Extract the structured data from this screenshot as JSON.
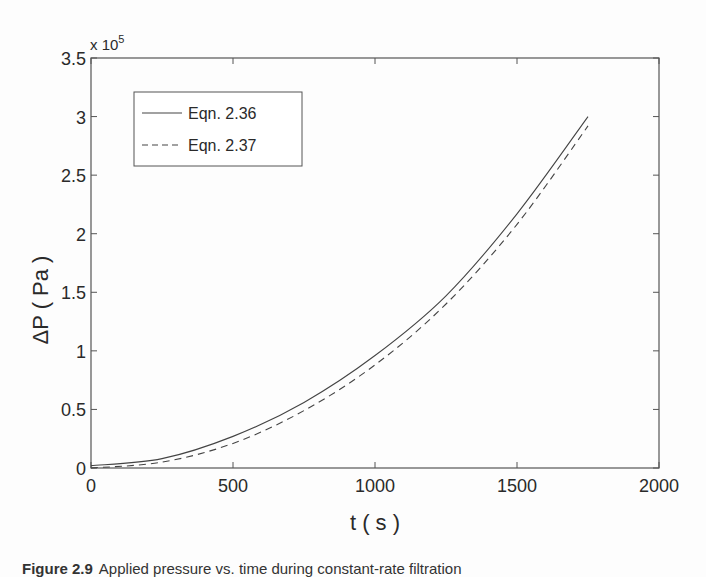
{
  "chart_data": {
    "type": "line",
    "title": "",
    "xlabel": "t ( s )",
    "ylabel": "ΔP ( Pa )",
    "y_multiplier": "x 10^5",
    "xlim": [
      0,
      2000
    ],
    "ylim": [
      0,
      3.5
    ],
    "x_ticks": [
      "0",
      "500",
      "1000",
      "1500",
      "2000"
    ],
    "y_ticks": [
      "0",
      "0.5",
      "1",
      "1.5",
      "2",
      "2.5",
      "3",
      "3.5"
    ],
    "grid": false,
    "legend_position": "upper-left",
    "x": [
      0,
      250,
      500,
      750,
      1000,
      1250,
      1500,
      1750
    ],
    "series": [
      {
        "name": "Eqn. 2.36",
        "style": "solid",
        "values": [
          0.02,
          0.08,
          0.27,
          0.56,
          0.96,
          1.47,
          2.17,
          3.0
        ]
      },
      {
        "name": "Eqn. 2.37",
        "style": "dashed",
        "values": [
          0.0,
          0.05,
          0.21,
          0.49,
          0.88,
          1.4,
          2.08,
          2.92
        ]
      }
    ]
  },
  "multiplier": {
    "base": "x 10",
    "exp": "5"
  },
  "legend": {
    "entry1": "Eqn. 2.36",
    "entry2": "Eqn. 2.37"
  },
  "caption": {
    "label": "Figure 2.9",
    "text": "Applied pressure vs. time during constant-rate filtration"
  }
}
